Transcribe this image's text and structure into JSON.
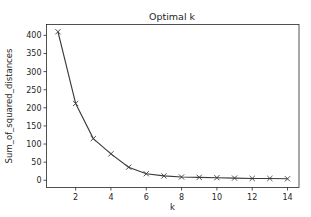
{
  "chart_data": {
    "type": "line",
    "title": "Optimal k",
    "xlabel": "k",
    "ylabel": "Sum_of_squared_distances",
    "x": [
      1,
      2,
      3,
      4,
      5,
      6,
      7,
      8,
      9,
      10,
      11,
      12,
      13,
      14
    ],
    "series": [
      {
        "name": "Sum_of_squared_distances",
        "values": [
          410,
          212,
          115,
          73,
          36,
          18,
          12,
          9,
          8,
          7,
          6,
          5,
          5,
          4
        ],
        "color": "#3a3a3a",
        "marker": "x"
      }
    ],
    "xticks": [
      2,
      4,
      6,
      8,
      10,
      12,
      14
    ],
    "yticks": [
      0,
      50,
      100,
      150,
      200,
      250,
      300,
      350,
      400
    ],
    "xlim": [
      0.35,
      14.65
    ],
    "ylim": [
      -20,
      430
    ],
    "grid": false,
    "legend": null
  }
}
